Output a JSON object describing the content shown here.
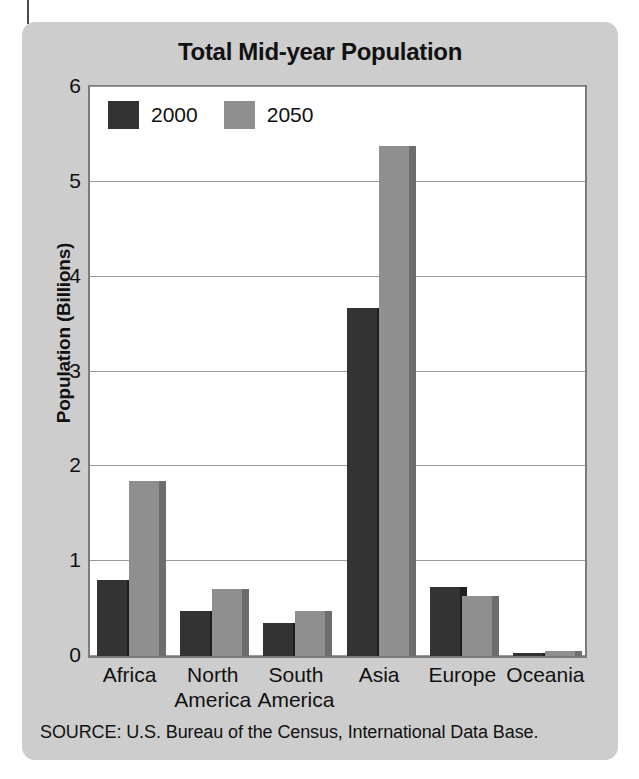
{
  "chart_data": {
    "type": "bar",
    "title": "Total Mid-year Population",
    "xlabel": "",
    "ylabel": "Population (Billions)",
    "ylim": [
      0,
      6
    ],
    "yticks": [
      "0",
      "1",
      "2",
      "3",
      "4",
      "5",
      "6"
    ],
    "grid": true,
    "legend_position": "top-left-inside",
    "categories": [
      "Africa",
      "North\nAmerica",
      "South\nAmerica",
      "Asia",
      "Europe",
      "Oceania"
    ],
    "series": [
      {
        "name": "2000",
        "color": "#333333",
        "values": [
          0.8,
          0.47,
          0.35,
          3.67,
          0.73,
          0.03
        ]
      },
      {
        "name": "2050",
        "color": "#8f8f8f",
        "values": [
          1.85,
          0.71,
          0.47,
          5.38,
          0.63,
          0.05
        ]
      }
    ],
    "source": "SOURCE: U.S. Bureau of the Census, International Data Base."
  }
}
